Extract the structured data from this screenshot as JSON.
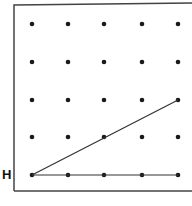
{
  "diagram": {
    "type": "geoboard dot grid",
    "frame": {
      "x": 14,
      "y": 5,
      "width": 190,
      "height": 186
    },
    "grid": {
      "columns_x": [
        32,
        68,
        104,
        142,
        178
      ],
      "rows_y": [
        24,
        62,
        100,
        137,
        175
      ]
    },
    "point_label": "H",
    "segments": [
      {
        "from": [
          0,
          0
        ],
        "to": [
          4,
          0
        ],
        "note": "horizontal segment from H along bottom row"
      },
      {
        "from": [
          0,
          0
        ],
        "to": [
          4,
          2
        ],
        "note": "slanted segment from H to right column, third row up"
      }
    ],
    "colors": {
      "dot": "#1a1a1a",
      "line": "#333333",
      "frame": "#444444"
    }
  }
}
